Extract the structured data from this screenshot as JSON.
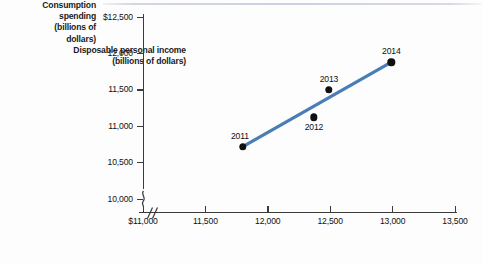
{
  "chart_data": {
    "type": "scatter",
    "title": "",
    "xlabel": "Disposable personal income (billions of dollars)",
    "ylabel": "Consumption spending (billions of dollars)",
    "xlim": [
      11000,
      13500
    ],
    "ylim": [
      10000,
      12500
    ],
    "grid": false,
    "legend": null,
    "axis_break": {
      "x": true,
      "y": true
    },
    "trendline": {
      "color": "#4a7db5",
      "from": [
        11800,
        10720
      ],
      "to": [
        12990,
        11880
      ]
    },
    "point_color": "#101010",
    "categories": [
      "2011",
      "2012",
      "2013",
      "2014"
    ],
    "x": [
      11800,
      12370,
      12490,
      12990
    ],
    "y": [
      10720,
      11120,
      11500,
      11880
    ],
    "points": [
      {
        "label": "2011",
        "x": 11800,
        "y": 10720,
        "label_pos": "top-left"
      },
      {
        "label": "2012",
        "x": 12370,
        "y": 11120,
        "label_pos": "bottom"
      },
      {
        "label": "2013",
        "x": 12490,
        "y": 11500,
        "label_pos": "top"
      },
      {
        "label": "2014",
        "x": 12990,
        "y": 11880,
        "label_pos": "top"
      }
    ]
  },
  "y_axis": {
    "title_line1": "Consumption",
    "title_line2": "spending",
    "title_line3": "(billions of",
    "title_line4": "dollars)",
    "ticks": [
      {
        "label": "$12,500",
        "value": 12500
      },
      {
        "label": "12,000",
        "value": 12000
      },
      {
        "label": "11,500",
        "value": 11500
      },
      {
        "label": "11,000",
        "value": 11000
      },
      {
        "label": "10,500",
        "value": 10500
      },
      {
        "label": "10,000",
        "value": 10000
      }
    ]
  },
  "x_axis": {
    "title_line1": "Disposable personal income",
    "title_line2": "(billions of dollars)",
    "ticks": [
      {
        "label": "$11,000",
        "value": 11000
      },
      {
        "label": "11,500",
        "value": 11500
      },
      {
        "label": "12,000",
        "value": 12000
      },
      {
        "label": "12,500",
        "value": 12500
      },
      {
        "label": "13,000",
        "value": 13000
      },
      {
        "label": "13,500",
        "value": 13500
      }
    ]
  }
}
